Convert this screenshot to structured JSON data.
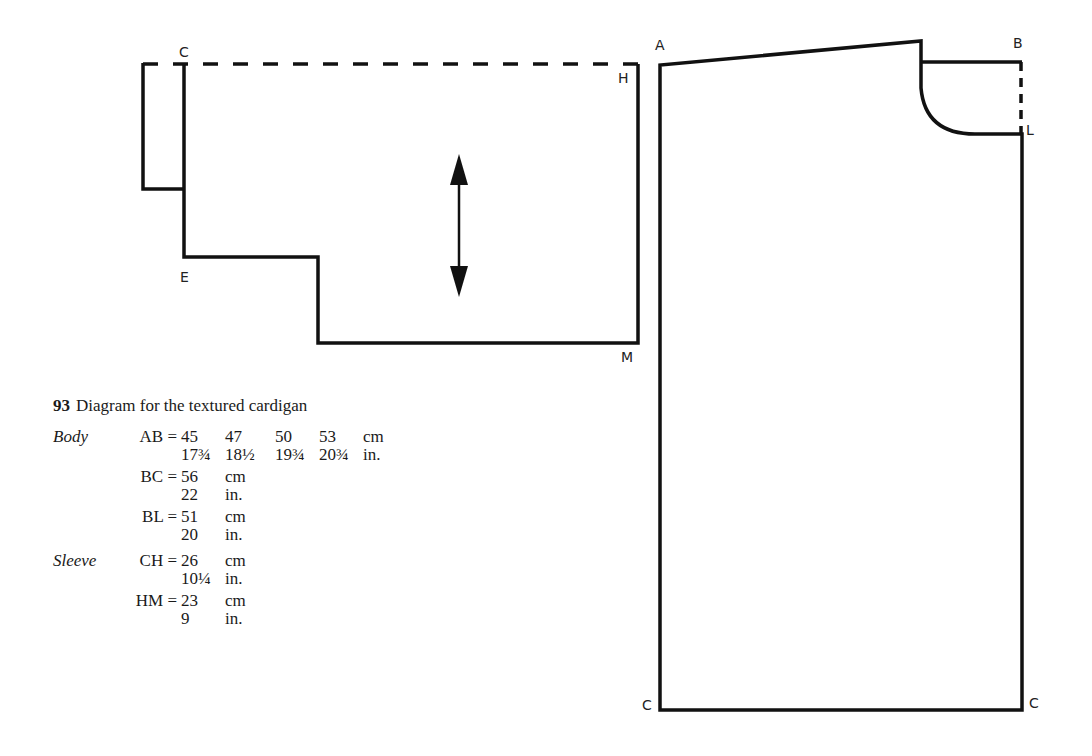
{
  "figure": {
    "number": "93",
    "title": "Diagram for the textured cardigan"
  },
  "diagram_labels": {
    "sleeve": {
      "C": "C",
      "H": "H",
      "E": "E",
      "M": "M"
    },
    "body": {
      "A": "A",
      "B": "B",
      "L": "L",
      "C_left": "C",
      "C_right": "C"
    }
  },
  "measurements": {
    "body": {
      "part_label": "Body",
      "AB": {
        "key": "AB =",
        "cm": [
          "45",
          "47",
          "50",
          "53"
        ],
        "in": [
          "17¾",
          "18½",
          "19¾",
          "20¾"
        ],
        "cm_unit": "cm",
        "in_unit": "in."
      },
      "BC": {
        "key": "BC =",
        "cm": "56",
        "in": "22",
        "cm_unit": "cm",
        "in_unit": "in."
      },
      "BL": {
        "key": "BL =",
        "cm": "51",
        "in": "20",
        "cm_unit": "cm",
        "in_unit": "in."
      }
    },
    "sleeve": {
      "part_label": "Sleeve",
      "CH": {
        "key": "CH =",
        "cm": "26",
        "in": "10¼",
        "cm_unit": "cm",
        "in_unit": "in."
      },
      "HM": {
        "key": "HM =",
        "cm": "23",
        "in": "9",
        "cm_unit": "cm",
        "in_unit": "in."
      }
    }
  },
  "colors": {
    "line": "#111111",
    "background": "#ffffff"
  }
}
